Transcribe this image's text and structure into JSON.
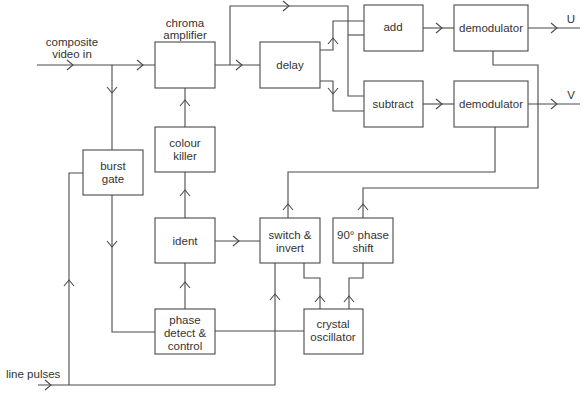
{
  "diagram": {
    "inputs": {
      "composite": [
        "composite",
        "video in"
      ],
      "line_pulses": "line pulses"
    },
    "outputs": {
      "u": "U",
      "v": "V"
    },
    "blocks": {
      "chroma_amp_label": [
        "chroma",
        "amplifier"
      ],
      "delay": [
        "delay"
      ],
      "add": [
        "add"
      ],
      "subtract": [
        "subtract"
      ],
      "demod_u": [
        "demodulator"
      ],
      "demod_v": [
        "demodulator"
      ],
      "burst_gate": [
        "burst",
        "gate"
      ],
      "colour_killer": [
        "colour",
        "killer"
      ],
      "ident": [
        "ident"
      ],
      "switch_invert": [
        "switch &",
        "invert"
      ],
      "phase_shift": [
        "90° phase",
        "shift"
      ],
      "phase_detect": [
        "phase",
        "detect &",
        "control"
      ],
      "crystal_osc": [
        "crystal",
        "oscillator"
      ]
    },
    "connections": [
      {
        "from": "composite video in",
        "to": "chroma amplifier"
      },
      {
        "from": "composite video in",
        "to": "burst gate"
      },
      {
        "from": "chroma amplifier",
        "to": "delay"
      },
      {
        "from": "chroma amplifier",
        "to": "add"
      },
      {
        "from": "chroma amplifier",
        "to": "subtract"
      },
      {
        "from": "delay",
        "to": "add"
      },
      {
        "from": "delay",
        "to": "subtract"
      },
      {
        "from": "add",
        "to": "demodulator U"
      },
      {
        "from": "subtract",
        "to": "demodulator V"
      },
      {
        "from": "demodulator U",
        "to": "U"
      },
      {
        "from": "demodulator V",
        "to": "V"
      },
      {
        "from": "burst gate",
        "to": "phase detect & control"
      },
      {
        "from": "line pulses",
        "to": "burst gate"
      },
      {
        "from": "line pulses",
        "to": "switch & invert"
      },
      {
        "from": "phase detect & control",
        "to": "ident"
      },
      {
        "from": "phase detect & control",
        "to": "crystal oscillator"
      },
      {
        "from": "ident",
        "to": "colour killer"
      },
      {
        "from": "ident",
        "to": "switch & invert"
      },
      {
        "from": "colour killer",
        "to": "chroma amplifier"
      },
      {
        "from": "crystal oscillator",
        "to": "switch & invert"
      },
      {
        "from": "crystal oscillator",
        "to": "90° phase shift"
      },
      {
        "from": "switch & invert",
        "to": "demodulator V"
      },
      {
        "from": "90° phase shift",
        "to": "demodulator U"
      }
    ]
  }
}
